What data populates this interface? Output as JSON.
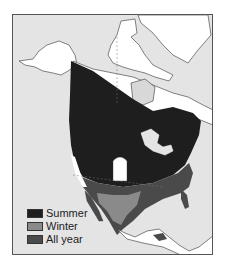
{
  "map": {
    "subject": "North America range map",
    "background_color": "#e4e4e4",
    "land_color": "#ffffff"
  },
  "legend": {
    "items": [
      {
        "label": "Summer",
        "color": "#1e1e1e"
      },
      {
        "label": "Winter",
        "color": "#8a8a8a"
      },
      {
        "label": "All year",
        "color": "#4a4a4a"
      }
    ]
  }
}
